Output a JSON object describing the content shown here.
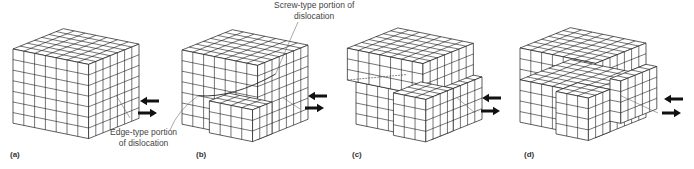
{
  "figure": {
    "panels": [
      {
        "id": "a",
        "label": "(a)",
        "state": "perfect crystal lattice block under shear"
      },
      {
        "id": "b",
        "label": "(b)",
        "state": "partial slip - mixed dislocation entering from front right"
      },
      {
        "id": "c",
        "label": "(c)",
        "state": "dislocation propagated further through crystal"
      },
      {
        "id": "d",
        "label": "(d)",
        "state": "slip complete - upper block displaced one lattice unit"
      }
    ],
    "annotations": {
      "screw": {
        "line1": "Screw-type portion of",
        "line2": "dislocation"
      },
      "edge": {
        "line1": "Edge-type portion",
        "line2": "of dislocation"
      }
    },
    "arrows": {
      "top_direction": "left",
      "bottom_direction": "right",
      "icon": "shear-arrow-icon"
    },
    "colors": {
      "line": "#1a1a1a",
      "face": "#ffffff",
      "text": "#333333",
      "guide": "#555555"
    },
    "lattice": {
      "cols": 7,
      "rows": 7,
      "depth": 7
    }
  }
}
